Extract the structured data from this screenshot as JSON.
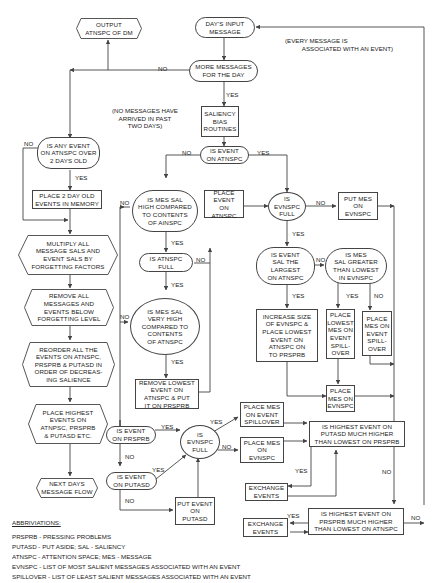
{
  "nodes": {
    "output_atnspc": "OUTPUT\nATNSPC OF DM",
    "days_input": "DAY'S INPUT\nMESSAGE",
    "more_messages": "MORE MESSAGES\nFOR THE DAY",
    "saliency_bias": "SALIENCY\nBIAS\nROUTINES",
    "is_event_on_atnspc": "IS EVENT\nON ATNSPC",
    "any_event_2days": "IS ANY EVENT\nON ATNSPC OVER\n2 DAYS OLD",
    "place_2day_memory": "PLACE 2 DAY OLD\nEVENTS IN MEMORY",
    "multiply_sals": "MULTIPLY ALL\nMESSAGE SALS AND\nEVENT SALS BY\nFORGETTING FACTORS",
    "remove_below": "REMOVE ALL\nMESSAGES AND\nEVENTS BELOW\nFORGETTING LEVEL",
    "reorder_events": "REORDER ALL THE\nEVENTS ON ATNSPC,\nPRSPRB & PUTASD IN\nORDER OF DECREAS-\nING SALIENCE",
    "place_highest": "PLACE HIGHEST\nEVENTS ON\nATNPSC, PRSPRB\n& PUTASD ETC.",
    "next_days": "NEXT DAYS\nMESSAGE FLOW",
    "mes_sal_high": "IS MES SAL\nHIGH COMPARED\nTO CONTENTS\nOF AINSPC",
    "place_event_atnspc": "PLACE\nEVENT\nON ATNSPC",
    "is_atnspc_full": "IS ATNSPC\nFULL",
    "mes_sal_very_high": "IS MES SAL\nVERY HIGH\nCOMPARED TO\nCONTENTS\nOF ATNSPC",
    "remove_lowest": "REMOVE LOWEST\nEVENT ON\nATNSPC & PUT\nIT ON PRSPRB",
    "is_evnspc_full_top": "IS\nEVNSPC\nFULL",
    "put_mes_evnspc": "PUT MES\nON\nEVNSPC",
    "event_sal_largest": "IS EVENT\nSAL THE\nLARGEST\nON ATNSPC",
    "mes_sal_greater": "IS MES\nSAL GREATER\nTHAN LOWEST\nIN EVNSPC",
    "increase_size": "INCREASE SIZE\nOF EVNSPC &\nPLACE LOWEST\nEVENT ON\nATNSPC ON\nTO PRSPRB",
    "place_lowest_spill": "PLACE\nLOWEST\nMES ON\nEVENT\nSPILL-\nOVER",
    "place_mes_spill": "PLACE\nMES ON\nEVENT\nSPILL-\nOVER",
    "place_mes_evnspc_mid": "PLACE\nMES ON\nEVNSPC",
    "is_event_prsprb": "IS EVENT\nON PRSPRB",
    "is_event_putasd": "IS EVENT\nON PUTASD",
    "is_evnspc_full_bottom": "IS\nEVNSPC\nFULL",
    "put_event_putasd": "PUT EVENT\nON\nPUTASD",
    "place_mes_spillover": "PLACE MES\nON EVENT\nSPILLOVER",
    "place_mes_evnspc_bottom": "PLACE MES\nON\nEVNSPC",
    "highest_putasd": "IS HIGHEST EVENT ON\nPUTASD MUCH HIGHER\nTHAN LOWEST ON PRSPRB",
    "exchange_events_1": "EXCHANGE\nEVENTS",
    "highest_prsprb": "IS HIGHEST EVENT ON\nPRSPRB MUCH HIGHER\nTHAN LOWEST ON ATNSPC",
    "exchange_events_2": "EXCHANGE\nEVENTS"
  },
  "notes": {
    "every_message": "(EVERY MESSAGE IS\n          ASSOCIATED WITH AN EVENT)",
    "no_messages": "(NO MESSAGES HAVE\nARRIVED IN PAST\nTWO DAYS)"
  },
  "labels": {
    "yes": "YES",
    "no": "NO"
  },
  "abbreviations": {
    "title": "ABBRIVIATIONS:",
    "items": [
      "PRSPRB - PRESSING PROBLEMS",
      "PUTASD - PUT ASIDE; SAL - SALIENCY",
      "ATNSPC - ATTENTION SPACE; MES - MESSAGE",
      "EVNSPC - LIST OF MOST SALIENT MESSAGES ASSOCIATED WITH AN EVENT",
      "SPILLOVER - LIST OF LEAST SALIENT MESSAGES ASSOCIATED WITH AN EVENT"
    ]
  },
  "colors": {
    "line": "#444444",
    "text": "#222222",
    "background": "#ffffff"
  }
}
